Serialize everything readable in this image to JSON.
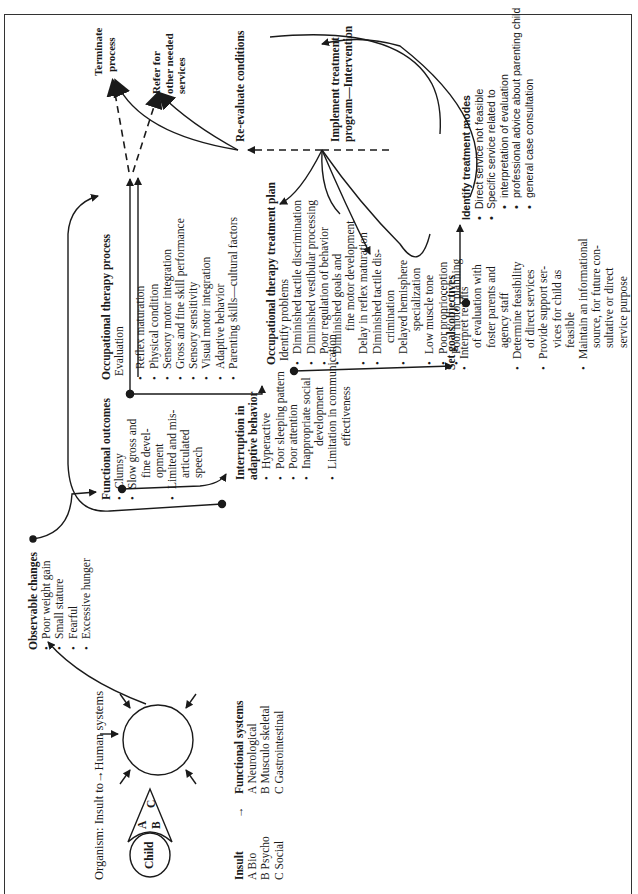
{
  "figure": {
    "organism_caption": "Organism: Insult to→Human systems",
    "child_label": "Child",
    "cone_labels": [
      "A",
      "B",
      "C"
    ],
    "legend": {
      "insult_header": "Insult",
      "arrow": "→",
      "systems_header": "Functional systems",
      "insults": [
        "A  Bio",
        "B  Psycho",
        "C  Social"
      ],
      "systems": [
        "A  Neurological",
        "B  Musculo skeletal",
        "C  Gastrointestinal"
      ]
    },
    "observable_changes": {
      "title": "Observable changes",
      "items": [
        "Poor weight gain",
        "Small stature",
        "Fearful",
        "Excessive hunger"
      ]
    },
    "functional_outcomes": {
      "title": "Functional outcomes",
      "items": [
        "Clumsy",
        "Slow gross and",
        "fine devel-",
        "opment",
        "Limited and mis-",
        "articulated",
        "speech"
      ]
    },
    "interruption": {
      "title_line1": "Interruption in",
      "title_line2": "adaptive behavior",
      "items": [
        "Hyperactive",
        "Poor sleeping pattern",
        "Poor attention",
        "Inappropriate social",
        "development",
        "Limitation in communication",
        "effectiveness"
      ]
    },
    "ot_process": {
      "title": "Occupational therapy process",
      "subtitle": "Evaluation",
      "items": [
        "Reflex maturation",
        "Physical condition",
        "Sensory motor integration",
        "Gross and fine skill performance",
        "Sensory sensitivity",
        "Visual motor integration",
        "Adaptive behavior",
        "Parenting skills—cultural factors"
      ]
    },
    "ot_plan": {
      "title": "Occupational therapy treatment plan",
      "subtitle": "Identify problems",
      "items": [
        "Diminished tactile discrimination",
        "Diminished vestibular processing",
        "Poor regulation of behavior",
        "Diminished goals and",
        "fine motor development",
        "Delay in reflex maturation",
        "Diminished tactile dis-",
        "crimination",
        "Delayed hemisphere",
        "specialization",
        "Low muscle tone",
        "Poor proprioception",
        "Poor motor planning"
      ]
    },
    "set_goals": {
      "title": "Set goals/objectives",
      "items": [
        "Interpret results",
        "of evaluation with",
        "foster parents and",
        "agency staff",
        "Determine feasibility",
        "of direct services",
        "Provide support ser-",
        "vices for child as",
        "feasible",
        "Maintain an informational",
        "source, for future con-",
        "sultative or direct",
        "service purpose"
      ]
    },
    "treatment_modes": {
      "title": "Identify treatment modes",
      "items": [
        "Direct service not feasible",
        "Specific service related to",
        "interpretation of evaluation",
        "professional advice about parenting child",
        "general case consultation"
      ]
    },
    "reevaluate": "Re-evaluate conditions",
    "implement_line1": "Implement treatment",
    "implement_line2": "program—Intervention",
    "terminate_line1": "Terminate",
    "terminate_line2": "process",
    "refer_line1": "Refer for",
    "refer_line2": "other needed",
    "refer_line3": "services"
  },
  "colors": {
    "ink": "#1a1a1a",
    "background": "#ffffff",
    "frame": "#333333"
  }
}
